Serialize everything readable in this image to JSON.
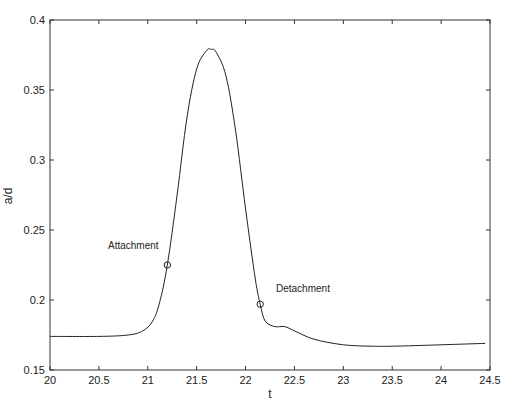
{
  "chart_data": {
    "type": "line",
    "title": "",
    "xlabel": "t",
    "ylabel": "a/d",
    "xlim": [
      20,
      24.5
    ],
    "ylim": [
      0.15,
      0.4
    ],
    "grid": false,
    "legend": null,
    "xticks": [
      "20",
      "20.5",
      "21",
      "21.5",
      "22",
      "22.5",
      "23",
      "23.5",
      "24",
      "24.5"
    ],
    "yticks": [
      "0.15",
      "0.2",
      "0.25",
      "0.3",
      "0.35",
      "0.4"
    ],
    "series": [
      {
        "name": "a/d",
        "x": [
          20.0,
          20.5,
          20.8,
          20.95,
          21.05,
          21.12,
          21.2,
          21.3,
          21.4,
          21.5,
          21.6,
          21.65,
          21.7,
          21.8,
          21.9,
          22.0,
          22.1,
          22.15,
          22.2,
          22.3,
          22.4,
          22.5,
          22.7,
          23.0,
          23.3,
          23.5,
          24.0,
          24.45
        ],
        "y": [
          0.174,
          0.174,
          0.175,
          0.178,
          0.185,
          0.198,
          0.225,
          0.275,
          0.33,
          0.365,
          0.378,
          0.379,
          0.377,
          0.36,
          0.32,
          0.265,
          0.215,
          0.197,
          0.185,
          0.181,
          0.181,
          0.178,
          0.172,
          0.168,
          0.167,
          0.167,
          0.168,
          0.169
        ]
      }
    ],
    "annotations": [
      {
        "text": "Attachment",
        "x": 21.2,
        "y": 0.225,
        "marker": "circle"
      },
      {
        "text": "Detachment",
        "x": 22.15,
        "y": 0.197,
        "marker": "circle"
      }
    ]
  },
  "labels": {
    "xlabel": "t",
    "ylabel": "a/d",
    "attachment": "Attachment",
    "detachment": "Detachment"
  }
}
